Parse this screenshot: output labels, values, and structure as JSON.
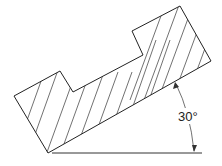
{
  "diagram": {
    "title": "",
    "angle_label": "30°",
    "angle_degrees": 30,
    "hatch_style": "diagonal section lines",
    "colors": {
      "line": "#222222",
      "background": "#ffffff"
    }
  }
}
